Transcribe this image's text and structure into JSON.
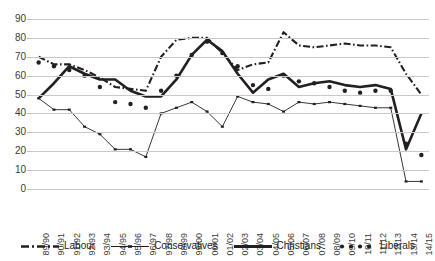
{
  "chart_data": {
    "type": "line",
    "title": "",
    "xlabel": "",
    "ylabel": "",
    "ylim": [
      0,
      90
    ],
    "yticks": [
      0,
      10,
      20,
      30,
      40,
      50,
      60,
      70,
      80,
      90
    ],
    "grid": true,
    "legend_position": "bottom",
    "categories": [
      "89/90",
      "90/91",
      "91/92",
      "92/93",
      "93/94",
      "94/95",
      "95/96",
      "96/97",
      "97/98",
      "98/99",
      "99/00",
      "00/01",
      "01/02",
      "02/03",
      "03/04",
      "04/05",
      "05/06",
      "06/07",
      "07/08",
      "08/09",
      "09/10",
      "10/11",
      "11/12",
      "12/13",
      "13/14",
      "14/15"
    ],
    "series": [
      {
        "name": "Labour",
        "style": "dash-dot",
        "values": [
          70,
          66,
          66,
          63,
          59,
          54,
          53,
          52,
          70,
          79,
          80,
          80,
          72,
          63,
          66,
          67,
          83,
          76,
          75,
          76,
          77,
          76,
          76,
          75,
          61,
          50
        ]
      },
      {
        "name": "Conservatives",
        "style": "thin-solid",
        "values": [
          48,
          42,
          42,
          33,
          29,
          21,
          21,
          17,
          40,
          43,
          46,
          41,
          33,
          49,
          46,
          45,
          41,
          46,
          45,
          46,
          45,
          44,
          43,
          43,
          4,
          4
        ]
      },
      {
        "name": "Christians",
        "style": "thick-solid",
        "values": [
          48,
          56,
          65,
          61,
          58,
          58,
          52,
          49,
          49,
          58,
          71,
          79,
          73,
          61,
          51,
          58,
          61,
          54,
          56,
          57,
          55,
          54,
          55,
          53,
          21,
          40
        ]
      },
      {
        "name": "Liberals",
        "style": "dotted",
        "values": [
          67,
          65,
          63,
          60,
          54,
          46,
          45,
          43,
          52,
          60,
          71,
          78,
          72,
          65,
          55,
          53,
          60,
          57,
          56,
          54,
          52,
          51,
          52,
          52,
          24,
          18
        ]
      }
    ]
  },
  "legend": {
    "items": [
      {
        "label": "Labour",
        "marker": "dash-dot-line-marker"
      },
      {
        "label": "Conservatives",
        "marker": "thin-solid-line-marker"
      },
      {
        "label": "Christians",
        "marker": "thick-solid-line-marker"
      },
      {
        "label": "Liberals",
        "marker": "dotted-line-marker"
      }
    ]
  },
  "colors": {
    "series": "#231f20",
    "gridline": "#c9c9c9",
    "text": "#3b3b3b",
    "background": "#ffffff"
  }
}
